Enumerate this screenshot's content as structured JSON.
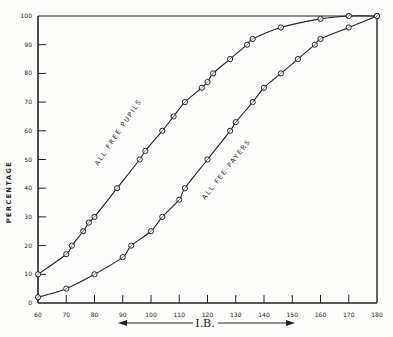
{
  "chart_data": {
    "type": "line",
    "title": "",
    "xlabel": "I.B.",
    "ylabel": "PERCENTAGE",
    "xlim": [
      60,
      180
    ],
    "ylim": [
      0,
      100
    ],
    "x_ticks": [
      60,
      70,
      80,
      90,
      100,
      110,
      120,
      130,
      140,
      150,
      160,
      170,
      180
    ],
    "y_ticks": [
      0,
      10,
      20,
      30,
      40,
      50,
      60,
      70,
      80,
      90,
      100
    ],
    "grid": false,
    "legend": "inline curve labels",
    "series": [
      {
        "name": "ALL FREE PUPILS",
        "marker": "circle",
        "points": [
          [
            60,
            10
          ],
          [
            70,
            17
          ],
          [
            72,
            20
          ],
          [
            76,
            25
          ],
          [
            78,
            28
          ],
          [
            80,
            30
          ],
          [
            88,
            40
          ],
          [
            96,
            50
          ],
          [
            98,
            53
          ],
          [
            104,
            60
          ],
          [
            108,
            65
          ],
          [
            112,
            70
          ],
          [
            118,
            75
          ],
          [
            120,
            77
          ],
          [
            122,
            80
          ],
          [
            128,
            85
          ],
          [
            134,
            90
          ],
          [
            136,
            92
          ],
          [
            146,
            96
          ],
          [
            160,
            99
          ],
          [
            170,
            100
          ],
          [
            180,
            100
          ]
        ]
      },
      {
        "name": "ALL FEE-PAYERS",
        "marker": "circle",
        "points": [
          [
            60,
            2
          ],
          [
            70,
            5
          ],
          [
            80,
            10
          ],
          [
            90,
            16
          ],
          [
            93,
            20
          ],
          [
            100,
            25
          ],
          [
            104,
            30
          ],
          [
            110,
            36
          ],
          [
            112,
            40
          ],
          [
            120,
            50
          ],
          [
            128,
            60
          ],
          [
            130,
            63
          ],
          [
            136,
            70
          ],
          [
            140,
            75
          ],
          [
            146,
            80
          ],
          [
            152,
            85
          ],
          [
            158,
            90
          ],
          [
            160,
            92
          ],
          [
            170,
            96
          ],
          [
            180,
            100
          ]
        ]
      }
    ],
    "annotations": [
      "I.B. (double-headed arrow beneath x-axis)"
    ]
  },
  "labels": {
    "ylabel": "PERCENTAGE",
    "xlabel": "I.B.",
    "free": "ALL FREE PUPILS",
    "fee": "ALL FEE-PAYERS"
  }
}
